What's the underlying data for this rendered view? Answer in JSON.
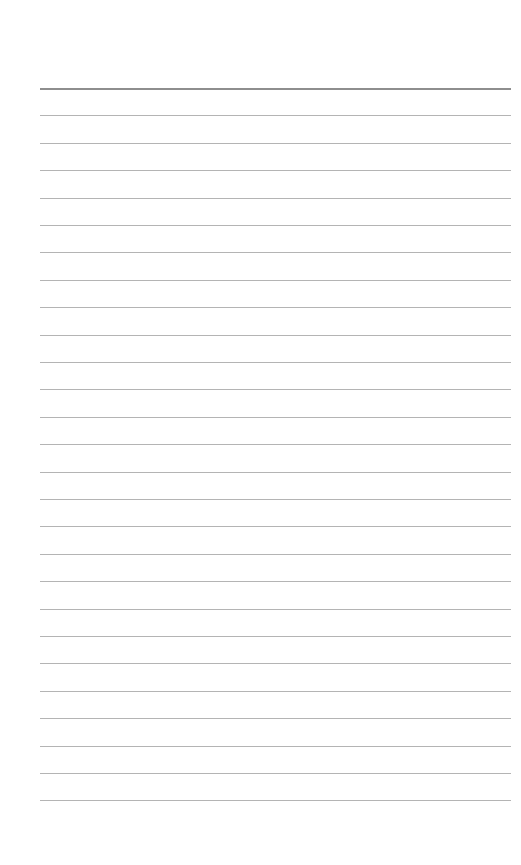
{
  "page": {
    "type": "lined-paper",
    "background_color": "#ffffff",
    "line_color": "#b4b4b4",
    "header_line_color": "#8e8e8e",
    "line_count": 27,
    "first_line_y": 88,
    "line_spacing": 27.4,
    "margin_left": 40,
    "margin_right": 10,
    "text": ""
  }
}
